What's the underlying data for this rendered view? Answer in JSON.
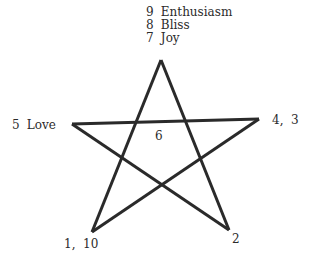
{
  "diagram": {
    "type": "pentagram",
    "stroke_color": "#2a2a2a",
    "stroke_width": 3,
    "vertices": {
      "top": [
        161,
        60
      ],
      "left": [
        72,
        124
      ],
      "right": [
        259,
        119
      ],
      "bottom_left": [
        92,
        232
      ],
      "bottom_right": [
        229,
        230
      ]
    },
    "labels": {
      "top": [
        {
          "num": "9",
          "text": "Enthusiasm"
        },
        {
          "num": "8",
          "text": "Bliss"
        },
        {
          "num": "7",
          "text": "Joy"
        }
      ],
      "left": {
        "num": "5",
        "text": "Love"
      },
      "right": {
        "text": "4,  3"
      },
      "center": {
        "text": "6"
      },
      "bottom_left": {
        "text": "1,  10"
      },
      "bottom_right": {
        "text": "2"
      }
    }
  }
}
